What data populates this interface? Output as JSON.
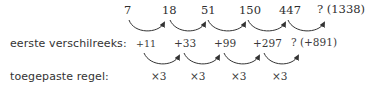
{
  "sequence": {
    "terms": [
      "7",
      "18",
      "51",
      "150",
      "447",
      "? (1338)"
    ]
  },
  "differences": {
    "label": "eerste verschilreeks:",
    "values": [
      "+11",
      "+33",
      "+99",
      "+297",
      "? (+891)"
    ]
  },
  "rule": {
    "label": "toegepaste regel:",
    "values": [
      "×3",
      "×3",
      "×3",
      "×3"
    ]
  },
  "colors": {
    "text": "#2e2e2e",
    "arrow": "#333333",
    "background": "#ffffff"
  }
}
